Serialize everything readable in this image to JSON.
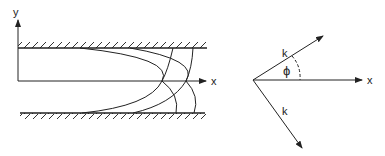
{
  "left_diagram": {
    "axis_y_label": "y",
    "axis_x_label": "x",
    "description": "Channel between two hatched walls with parabolic and arc wavefront curves"
  },
  "right_diagram": {
    "vector_top_label": "k",
    "vector_bottom_label": "k",
    "angle_label": "ϕ",
    "axis_x_label": "x"
  },
  "colors": {
    "stroke": "#222222",
    "background": "#ffffff"
  }
}
